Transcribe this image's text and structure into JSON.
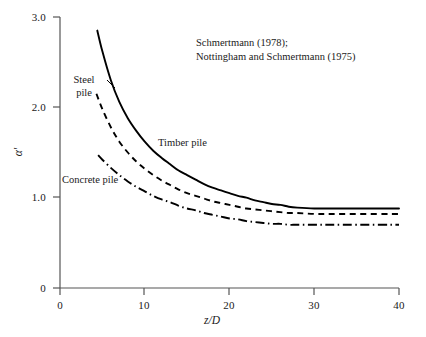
{
  "chart_data": {
    "type": "line",
    "title": "",
    "xlabel": "z/D",
    "ylabel": "α'",
    "xlim": [
      0,
      40
    ],
    "ylim": [
      0,
      3.0
    ],
    "xticks": [
      "0",
      "10",
      "20",
      "30",
      "40"
    ],
    "yticks": [
      "0",
      "1.0",
      "2.0",
      "3.0"
    ],
    "xtick_values": [
      0,
      10,
      20,
      30,
      40
    ],
    "ytick_values": [
      0,
      1.0,
      2.0,
      3.0
    ],
    "grid": false,
    "legend": "inline-curve-labels",
    "annotations": [
      "Schmertmann (1978);",
      "Nottingham and Schmertmann (1975)"
    ],
    "series": [
      {
        "name": "Timber pile",
        "style": "solid",
        "color": "#000000",
        "x": [
          4.4,
          5,
          6,
          7,
          8,
          9,
          10,
          11,
          12,
          13,
          14,
          15,
          16,
          17,
          18,
          19,
          20,
          21,
          22,
          23,
          24,
          25,
          26,
          27,
          28,
          30,
          32,
          35,
          40
        ],
        "y": [
          2.85,
          2.62,
          2.3,
          2.06,
          1.88,
          1.74,
          1.62,
          1.52,
          1.44,
          1.37,
          1.3,
          1.25,
          1.2,
          1.15,
          1.11,
          1.08,
          1.05,
          1.02,
          1.0,
          0.97,
          0.95,
          0.93,
          0.92,
          0.9,
          0.89,
          0.88,
          0.88,
          0.88,
          0.88
        ]
      },
      {
        "name": "Steel pile",
        "style": "dashed",
        "color": "#000000",
        "x": [
          4.3,
          5,
          6,
          7,
          8,
          9,
          10,
          11,
          12,
          13,
          14,
          15,
          16,
          17,
          18,
          19,
          20,
          21,
          22,
          23,
          24,
          25,
          26,
          27,
          28,
          30,
          32,
          35,
          40
        ],
        "y": [
          2.15,
          1.98,
          1.78,
          1.62,
          1.5,
          1.4,
          1.32,
          1.25,
          1.19,
          1.14,
          1.09,
          1.05,
          1.02,
          0.99,
          0.96,
          0.94,
          0.92,
          0.9,
          0.88,
          0.87,
          0.86,
          0.85,
          0.84,
          0.83,
          0.83,
          0.82,
          0.82,
          0.82,
          0.82
        ]
      },
      {
        "name": "Concrete pile",
        "style": "dash-dot",
        "color": "#000000",
        "x": [
          4.5,
          5,
          6,
          7,
          8,
          9,
          10,
          11,
          12,
          13,
          14,
          15,
          16,
          17,
          18,
          19,
          20,
          21,
          22,
          23,
          24,
          25,
          26,
          27,
          28,
          30,
          32,
          35,
          40
        ],
        "y": [
          1.47,
          1.42,
          1.33,
          1.25,
          1.18,
          1.12,
          1.07,
          1.02,
          0.98,
          0.95,
          0.91,
          0.88,
          0.86,
          0.83,
          0.81,
          0.79,
          0.77,
          0.76,
          0.74,
          0.73,
          0.72,
          0.71,
          0.71,
          0.7,
          0.7,
          0.7,
          0.7,
          0.7,
          0.7
        ]
      }
    ]
  },
  "axes": {
    "y_ticks": [
      {
        "label": "3.0"
      },
      {
        "label": "2.0"
      },
      {
        "label": "1.0"
      },
      {
        "label": "0"
      }
    ],
    "x_ticks": [
      {
        "label": "0"
      },
      {
        "label": "10"
      },
      {
        "label": "20"
      },
      {
        "label": "30"
      },
      {
        "label": "40"
      }
    ],
    "x_title": "z/D",
    "y_title": "α'"
  },
  "labels": {
    "steel_line1": "Steel",
    "steel_line2": "pile",
    "timber": "Timber pile",
    "concrete": "Concrete pile"
  },
  "citation": {
    "line1": "Schmertmann (1978);",
    "line2": "Nottingham and Schmertmann (1975)"
  },
  "colors": {
    "axis": "#555555",
    "curve": "#000000",
    "background": "#ffffff"
  }
}
